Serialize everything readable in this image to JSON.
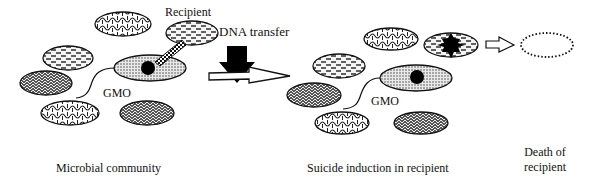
{
  "diagram": {
    "labels": {
      "recipient": "Recipient",
      "dna_transfer": "DNA transfer",
      "gmo_left": "GMO",
      "gmo_right": "GMO",
      "microbial_community": "Microbial community",
      "suicide_induction": "Suicide induction in recipient",
      "death_of_recipient_line1": "Death of",
      "death_of_recipient_line2": "recipient"
    },
    "panels": [
      {
        "id": "microbial-community",
        "caption": "Microbial community"
      },
      {
        "id": "suicide-induction",
        "caption": "Suicide induction in recipient"
      },
      {
        "id": "death",
        "caption": "Death of recipient"
      }
    ],
    "cell_types": {
      "gmo": "stippled ellipse with black nucleus",
      "recipient": "dashed-pattern ellipse",
      "other_a": "wavy brick pattern ellipse",
      "other_b": "dark herringbone pattern ellipse",
      "dead_recipient": "dotted outline ellipse"
    },
    "colors": {
      "ink": "#111111",
      "background": "#ffffff"
    }
  }
}
